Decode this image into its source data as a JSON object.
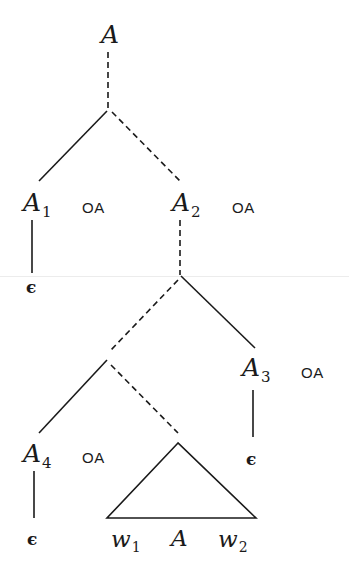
{
  "diagram": {
    "title": "",
    "stroke_color": "#1a1a1a",
    "nodes": {
      "root": {
        "label": "A"
      },
      "a1": {
        "label": "A",
        "sub": "1",
        "annotation": "OA"
      },
      "a2": {
        "label": "A",
        "sub": "2",
        "annotation": "OA"
      },
      "a3": {
        "label": "A",
        "sub": "3",
        "annotation": "OA"
      },
      "a4": {
        "label": "A",
        "sub": "4",
        "annotation": "OA"
      },
      "eps1": {
        "label": "ϵ"
      },
      "eps3": {
        "label": "ϵ"
      },
      "eps4": {
        "label": "ϵ"
      },
      "subtree": {
        "shape": "triangle",
        "left": {
          "label": "w",
          "sub": "1"
        },
        "center": {
          "label": "A"
        },
        "right": {
          "label": "w",
          "sub": "2"
        }
      }
    },
    "edges": [
      {
        "from": "root",
        "to": "branch1",
        "style": "dashed"
      },
      {
        "from": "branch1",
        "to": "a1",
        "style": "solid"
      },
      {
        "from": "branch1",
        "to": "a2",
        "style": "dashed"
      },
      {
        "from": "a1",
        "to": "eps1",
        "style": "solid"
      },
      {
        "from": "a2",
        "to": "branch2",
        "style": "dashed"
      },
      {
        "from": "branch2",
        "to": "branch3",
        "style": "dashed"
      },
      {
        "from": "branch2",
        "to": "a3",
        "style": "solid"
      },
      {
        "from": "a3",
        "to": "eps3",
        "style": "solid"
      },
      {
        "from": "branch3",
        "to": "a4",
        "style": "solid"
      },
      {
        "from": "branch3",
        "to": "subtree",
        "style": "dashed"
      },
      {
        "from": "a4",
        "to": "eps4",
        "style": "solid"
      }
    ]
  }
}
